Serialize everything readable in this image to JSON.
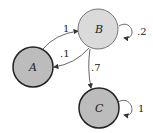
{
  "diagram": {
    "type": "markov-chain-state-diagram",
    "nodes": [
      {
        "id": "A",
        "label": "A",
        "fill": "#bcbcbc",
        "stroke": "#222222"
      },
      {
        "id": "B",
        "label": "B",
        "fill": "#dadada",
        "stroke": "#777777"
      },
      {
        "id": "C",
        "label": "C",
        "fill": "#bcbcbc",
        "stroke": "#222222"
      }
    ],
    "edges": [
      {
        "from": "A",
        "to": "B",
        "label": "1"
      },
      {
        "from": "B",
        "to": "A",
        "label": ".1"
      },
      {
        "from": "B",
        "to": "B",
        "label": ".2"
      },
      {
        "from": "B",
        "to": "C",
        "label": ".7"
      },
      {
        "from": "C",
        "to": "C",
        "label": "1"
      }
    ]
  }
}
